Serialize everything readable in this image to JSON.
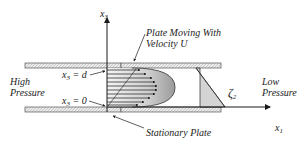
{
  "diagram": {
    "axes": {
      "vertical": {
        "label": "x",
        "subscript": "3"
      },
      "horizontal": {
        "label": "x",
        "subscript": "1"
      }
    },
    "labels": {
      "top_plate": "Plate Moving With",
      "top_plate_line2": "Velocity U",
      "bottom_plate": "Stationary Plate",
      "left_region_line1": "High",
      "left_region_line2": "Pressure",
      "right_region_line1": "Low",
      "right_region_line2": "Pressure",
      "x3_d": "= d",
      "x3_0": "= 0",
      "zeta": "ζ",
      "zeta_sub": "2"
    },
    "colors": {
      "line": "#1a1a1a",
      "plate_fill": "#e8e8e8",
      "profile_fill": "#c8c8c8",
      "triangle_fill": "#d0d0d0",
      "text": "#222222"
    }
  }
}
